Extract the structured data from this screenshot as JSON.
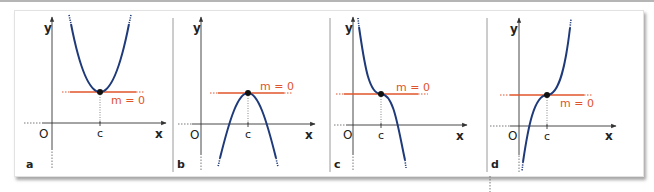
{
  "figure": {
    "panels": [
      {
        "id": "a",
        "label": "a",
        "y_axis": "y",
        "x_axis": "x",
        "origin": "O",
        "point_label": "c",
        "tangent_label": "m = 0",
        "curve": "upward parabola, minimum at c"
      },
      {
        "id": "b",
        "label": "b",
        "y_axis": "y",
        "x_axis": "x",
        "origin": "O",
        "point_label": "c",
        "tangent_label": "m = 0",
        "curve": "downward parabola, maximum at c"
      },
      {
        "id": "c",
        "label": "c",
        "y_axis": "y",
        "x_axis": "x",
        "origin": "O",
        "point_label": "c",
        "tangent_label": "m = 0",
        "curve": "decreasing cubic, horizontal inflection at c"
      },
      {
        "id": "d",
        "label": "d",
        "y_axis": "y",
        "x_axis": "x",
        "origin": "O",
        "point_label": "c",
        "tangent_label": "m = 0",
        "curve": "increasing cubic, horizontal inflection at c"
      }
    ],
    "colors": {
      "curve": "#1f3a7a",
      "tangent": "#e0542a",
      "axis": "#333333",
      "point": "#111111"
    }
  }
}
